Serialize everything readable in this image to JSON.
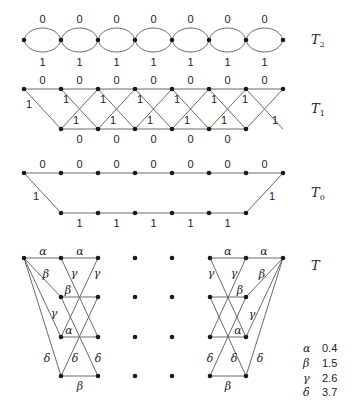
{
  "diagrams": {
    "T2": {
      "name": "T",
      "sub": "2",
      "top_labels": [
        "0",
        "0",
        "0",
        "0",
        "0",
        "0",
        "0"
      ],
      "bottom_labels": [
        "1",
        "1",
        "1",
        "1",
        "1",
        "1",
        "1"
      ]
    },
    "T1": {
      "name": "T",
      "sub": "1",
      "top_labels": [
        "0",
        "0",
        "0",
        "0",
        "0",
        "0",
        "0"
      ],
      "bottom_labels": [
        "0",
        "0",
        "0",
        "0",
        "0"
      ],
      "diag_label": "1"
    },
    "T0": {
      "name": "T",
      "sub": "0",
      "top_labels": [
        "0",
        "0",
        "0",
        "0",
        "0",
        "0",
        "0"
      ],
      "bottom_labels": [
        "1",
        "1",
        "1",
        "1",
        "1"
      ],
      "left_label": "1",
      "right_label": "1"
    },
    "T": {
      "name": "T",
      "sub": ""
    }
  },
  "symbols": {
    "alpha": "α",
    "beta": "β",
    "gamma": "γ",
    "delta": "δ"
  },
  "legend": [
    {
      "symbol": "α",
      "value": "0.4"
    },
    {
      "symbol": "β",
      "value": "1.5"
    },
    {
      "symbol": "γ",
      "value": "2.6"
    },
    {
      "symbol": "δ",
      "value": "3.7"
    }
  ]
}
